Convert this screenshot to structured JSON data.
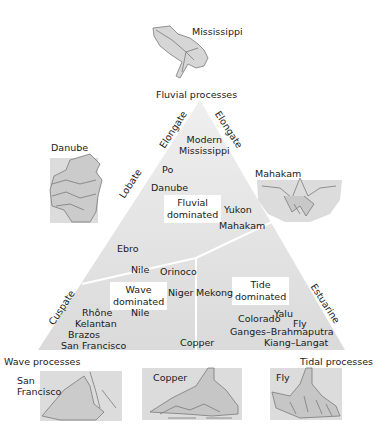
{
  "corners": {
    "top": "Fluvial processes",
    "left": "Wave processes",
    "right": "Tidal processes"
  },
  "edge_labels": {
    "left_upper": "Elongate",
    "right_upper": "Elongate",
    "left_middle": "Lobate",
    "left_lower": "Cuspate",
    "right_lower": "Estuarine"
  },
  "regions": {
    "fluvial": "Fluvial\ndominated",
    "wave": "Wave\ndominated",
    "tide": "Tide\ndominated"
  },
  "deltas": {
    "modern_mississippi": "Modern\nMississippi",
    "po": "Po",
    "danube": "Danube",
    "yukon": "Yukon",
    "mahakam": "Mahakam",
    "ebro": "Ebro",
    "nile_1": "Nile",
    "orinoco": "Orinoco",
    "niger": "Niger",
    "mekong": "Mekong",
    "nile_2": "Nile",
    "rhone": "Rhône",
    "kelantan": "Kelantan",
    "brazos": "Brazos",
    "san_francisco": "San Francisco",
    "copper": "Copper",
    "yalu": "Yalu",
    "colorado": "Colorado",
    "fly": "Fly",
    "ganges": "Ganges–Brahmaputra",
    "kiang": "Kiang–Langat"
  },
  "maps": {
    "mississippi": "Mississippi",
    "danube": "Danube",
    "mahakam": "Mahakam",
    "san_francisco": "San\nFrancisco",
    "copper": "Copper",
    "fly": "Fly"
  },
  "colors": {
    "triangle_light": "#ececec",
    "triangle_dark": "#dcdcdc",
    "map_fill": "#d6d6d6",
    "map_line": "#7a7a7a"
  }
}
